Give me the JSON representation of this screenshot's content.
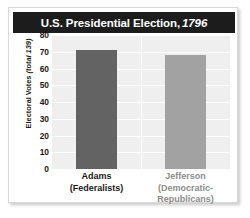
{
  "figure": {
    "title_main": "U.S. Presidential Election,",
    "title_year": "1796"
  },
  "chart_data": {
    "type": "bar",
    "xlabel": "",
    "ylabel": "Electoral Votes (total 139)",
    "ylabel_prefix": "Electoral Votes",
    "ylabel_total": "(total 139)",
    "ylim": [
      0,
      80
    ],
    "ytick_step": 10,
    "yticks": [
      "80",
      "70",
      "60",
      "50",
      "40",
      "30",
      "20",
      "10",
      "0"
    ],
    "grid": true,
    "legend": "none",
    "categories": [
      "Adams",
      "Jefferson"
    ],
    "category_sublabels": [
      "(Federalists)",
      "(Democratic-",
      "Republicans)"
    ],
    "values": [
      71,
      68
    ],
    "bars": [
      {
        "name": "Adams",
        "party_line1": "(Federalists)",
        "party_line2": "",
        "value": 71,
        "color": "#636363",
        "label_color": "#1a1a1a"
      },
      {
        "name": "Jefferson",
        "party_line1": "(Democratic-",
        "party_line2": "Republicans)",
        "value": 68,
        "color": "#a2a2a2",
        "label_color": "#8c8c8c"
      }
    ],
    "colors": {
      "plot_background": "#efefef",
      "gridline": "#ffffff",
      "title_background": "#1c1c1c",
      "title_text": "#ffffff",
      "card_background": "#ffffff"
    }
  }
}
